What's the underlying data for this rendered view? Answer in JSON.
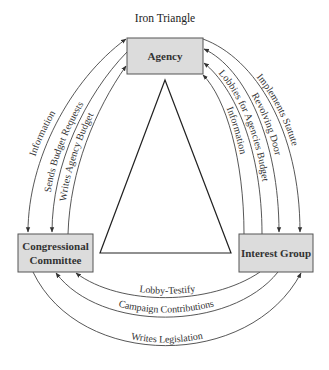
{
  "title": "Iron Triangle",
  "nodes": {
    "agency": {
      "label": "Agency"
    },
    "congressional_committee": {
      "label_line1": "Congressional",
      "label_line2": "Committee"
    },
    "interest_group": {
      "label": "Interest Group"
    }
  },
  "edges": {
    "left": [
      {
        "label": "Information",
        "between": "Agency - Congressional Committee",
        "direction": "both"
      },
      {
        "label": "Sends Budget Requests",
        "between": "Agency - Congressional Committee",
        "direction": "to Congressional Committee"
      },
      {
        "label": "Writes Agency Budget",
        "between": "Congressional Committee - Agency",
        "direction": "to Agency"
      }
    ],
    "right": [
      {
        "label": "Implements Statute",
        "between": "Agency - Interest Group",
        "direction": "to Interest Group"
      },
      {
        "label": "Revolving Door",
        "between": "Agency - Interest Group",
        "direction": "both"
      },
      {
        "label": "Lobbies for Agencies Budget",
        "between": "Interest Group - Agency",
        "direction": "to Agency"
      },
      {
        "label": "Information",
        "between": "Interest Group - Agency",
        "direction": "to Agency"
      }
    ],
    "bottom": [
      {
        "label": "Lobby-Testify",
        "between": "Interest Group - Congressional Committee",
        "direction": "to Congressional Committee"
      },
      {
        "label": "Campaign Contributions",
        "between": "Interest Group - Congressional Committee",
        "direction": "to Congressional Committee"
      },
      {
        "label": "Writes Legislation",
        "between": "Congressional Committee - Interest Group",
        "direction": "to Interest Group"
      }
    ]
  },
  "colors": {
    "box_fill": "#dcdcdc",
    "box_stroke": "#555555",
    "line": "#444444"
  }
}
